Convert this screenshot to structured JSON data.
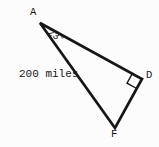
{
  "figure": {
    "type": "right-triangle-diagram",
    "vertices": {
      "a": "A",
      "d": "D",
      "f": "F"
    },
    "angle_at_a": "23°",
    "side_af_label": "200 miles",
    "line_color": "#161616",
    "background_color": "#fcfcfc"
  }
}
